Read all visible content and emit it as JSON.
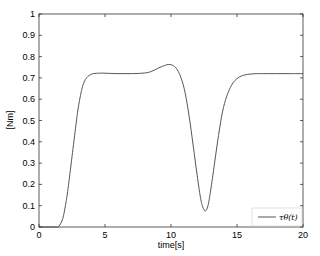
{
  "chart_data": {
    "type": "line",
    "title": "",
    "xlabel": "time[s]",
    "ylabel": "[Nm]",
    "xlim": [
      0,
      20
    ],
    "ylim": [
      0,
      1
    ],
    "xticks": [
      0,
      5,
      10,
      15,
      20
    ],
    "yticks": [
      0,
      0.1,
      0.2,
      0.3,
      0.4,
      0.5,
      0.6,
      0.7,
      0.8,
      0.9,
      1
    ],
    "grid": false,
    "legend_position": "lower right",
    "series": [
      {
        "name": "τ_θ(t)",
        "color": "#555555",
        "x": [
          0,
          1.2,
          1.5,
          1.8,
          2.0,
          2.2,
          2.5,
          2.8,
          3.0,
          3.3,
          3.6,
          4.0,
          4.5,
          5,
          6,
          7,
          8,
          8.5,
          9,
          9.5,
          9.8,
          10.1,
          10.4,
          10.7,
          11.0,
          11.3,
          11.6,
          11.9,
          12.2,
          12.4,
          12.6,
          12.8,
          13.0,
          13.3,
          13.6,
          13.9,
          14.2,
          14.5,
          14.8,
          15.2,
          15.6,
          16.0,
          16.5,
          17,
          18,
          19,
          20
        ],
        "y": [
          0,
          0,
          0.003,
          0.04,
          0.1,
          0.18,
          0.33,
          0.48,
          0.57,
          0.66,
          0.7,
          0.718,
          0.722,
          0.722,
          0.72,
          0.72,
          0.723,
          0.73,
          0.745,
          0.758,
          0.763,
          0.76,
          0.745,
          0.71,
          0.65,
          0.55,
          0.42,
          0.28,
          0.15,
          0.095,
          0.075,
          0.1,
          0.17,
          0.3,
          0.43,
          0.54,
          0.61,
          0.655,
          0.685,
          0.705,
          0.714,
          0.718,
          0.72,
          0.72,
          0.72,
          0.72,
          0.72
        ]
      }
    ]
  },
  "legend": {
    "label": "τθ(t)"
  },
  "axes": {
    "xlabel": "time[s]",
    "ylabel": "[Nm]"
  }
}
